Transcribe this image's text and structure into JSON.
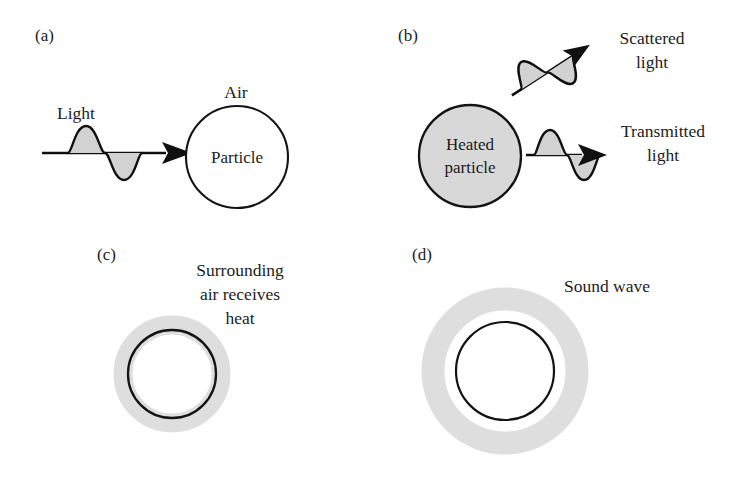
{
  "figure": {
    "background_color": "#ffffff",
    "ink_color": "#1c1c1c",
    "gray_fill_color": "#d8d8d8",
    "ring_gray_color": "#dedede",
    "wave_fill_color": "#d2d2d2"
  },
  "panels": [
    {
      "id": "a",
      "letter": "(a)",
      "labels": {
        "wave": "Light",
        "medium": "Air",
        "circle": "Particle"
      }
    },
    {
      "id": "b",
      "letter": "(b)",
      "labels": {
        "circle_line1": "Heated",
        "circle_line2": "particle",
        "scattered_line1": "Scattered",
        "scattered_line2": "light",
        "transmitted_line1": "Transmitted",
        "transmitted_line2": "light"
      }
    },
    {
      "id": "c",
      "letter": "(c)",
      "labels": {
        "line1": "Surrounding",
        "line2": "air receives",
        "line3": "heat"
      }
    },
    {
      "id": "d",
      "letter": "(d)",
      "labels": {
        "line1": "Sound wave"
      }
    }
  ]
}
